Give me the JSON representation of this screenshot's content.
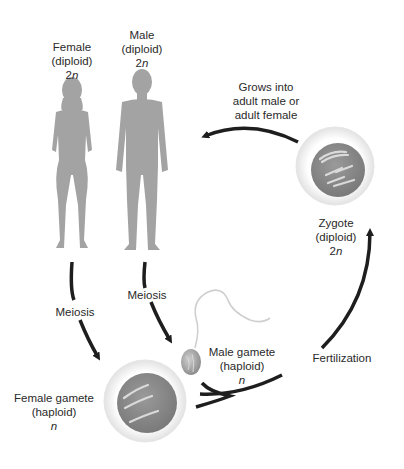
{
  "labels": {
    "female": {
      "line1": "Female",
      "line2": "(diploid)",
      "line3_num": "2",
      "line3_var": "n"
    },
    "male": {
      "line1": "Male",
      "line2": "(diploid)",
      "line3_num": "2",
      "line3_var": "n"
    },
    "grows": {
      "line1": "Grows into",
      "line2": "adult male or",
      "line3": "adult female"
    },
    "zygote": {
      "line1": "Zygote",
      "line2": "(diploid)",
      "line3_num": "2",
      "line3_var": "n"
    },
    "meiosis_female": "Meiosis",
    "meiosis_male": "Meiosis",
    "male_gamete": {
      "line1": "Male gamete",
      "line2": "(haploid)",
      "line3_var": "n"
    },
    "female_gamete": {
      "line1": "Female gamete",
      "line2": "(haploid)",
      "line3_var": "n"
    },
    "fertilization": "Fertilization"
  },
  "colors": {
    "silhouette": "#a3a3a3",
    "arrow": "#1e1e1e",
    "cell_outer": "#efefef",
    "cell_nucleus": "#8a8a8a",
    "chromosome": "#d8d8d8"
  }
}
